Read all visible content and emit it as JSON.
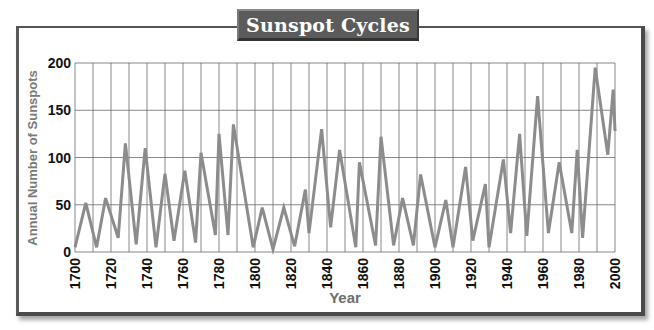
{
  "title": "Sunspot Cycles",
  "chart_data": {
    "type": "line",
    "title": "Sunspot Cycles",
    "xlabel": "Year",
    "ylabel": "Annual Number of Sunspots",
    "xlim": [
      1700,
      2000
    ],
    "ylim": [
      0,
      200
    ],
    "x_ticks": [
      1700,
      1720,
      1740,
      1760,
      1780,
      1800,
      1820,
      1840,
      1860,
      1880,
      1900,
      1920,
      1940,
      1960,
      1980,
      2000
    ],
    "y_ticks": [
      0,
      50,
      100,
      150,
      200
    ],
    "grid": {
      "vertical_every_years": 10,
      "horizontal_every": 50
    },
    "line_color": "#8c8c8c",
    "x": [
      1700,
      1706,
      1712,
      1717,
      1724,
      1728,
      1734,
      1739,
      1745,
      1750,
      1755,
      1761,
      1767,
      1770,
      1778,
      1780,
      1785,
      1788,
      1799,
      1804,
      1810,
      1816,
      1822,
      1828,
      1830,
      1837,
      1842,
      1847,
      1856,
      1858,
      1867,
      1870,
      1877,
      1882,
      1888,
      1892,
      1900,
      1906,
      1910,
      1917,
      1921,
      1928,
      1930,
      1938,
      1942,
      1947,
      1951,
      1957,
      1963,
      1969,
      1976,
      1979,
      1982,
      1989,
      1996,
      1999,
      2000
    ],
    "values": [
      5,
      52,
      5,
      57,
      15,
      115,
      8,
      110,
      5,
      83,
      12,
      86,
      10,
      105,
      18,
      125,
      18,
      135,
      5,
      47,
      3,
      47,
      6,
      66,
      20,
      130,
      26,
      108,
      5,
      95,
      7,
      122,
      7,
      57,
      7,
      82,
      5,
      55,
      5,
      90,
      12,
      72,
      5,
      98,
      20,
      125,
      17,
      165,
      20,
      95,
      20,
      108,
      15,
      195,
      103,
      172,
      128
    ]
  }
}
